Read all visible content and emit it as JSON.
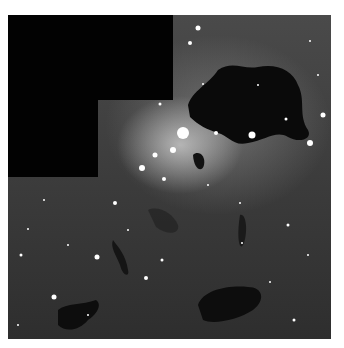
{
  "image": {
    "description": "Hubble WFPC2 mosaic of a star-forming region with dark dust globules and bright stars",
    "colors": {
      "background": "#3c3c3c",
      "mask": "#020202",
      "glow": "#ffffff",
      "dust": "#0a0a0a"
    },
    "stars": [
      [
        190,
        13,
        2.5
      ],
      [
        182,
        28,
        2
      ],
      [
        302,
        26,
        1
      ],
      [
        195,
        69,
        1
      ],
      [
        152,
        89,
        1.5
      ],
      [
        175,
        118,
        6
      ],
      [
        165,
        135,
        3
      ],
      [
        147,
        140,
        2.5
      ],
      [
        134,
        153,
        3
      ],
      [
        156,
        164,
        2
      ],
      [
        208,
        118,
        2
      ],
      [
        244,
        120,
        3.5
      ],
      [
        302,
        128,
        3
      ],
      [
        315,
        100,
        2.5
      ],
      [
        278,
        104,
        1.5
      ],
      [
        107,
        188,
        2
      ],
      [
        89,
        242,
        2.5
      ],
      [
        154,
        245,
        1.5
      ],
      [
        138,
        263,
        2
      ],
      [
        46,
        282,
        2.5
      ],
      [
        13,
        240,
        1.5
      ],
      [
        20,
        214,
        1
      ],
      [
        36,
        185,
        1
      ],
      [
        232,
        188,
        1
      ],
      [
        280,
        210,
        1.5
      ],
      [
        234,
        228,
        1
      ],
      [
        262,
        267,
        1
      ],
      [
        286,
        305,
        1.5
      ],
      [
        10,
        310,
        1
      ],
      [
        80,
        300,
        1
      ],
      [
        200,
        170,
        1
      ],
      [
        120,
        215,
        1
      ],
      [
        300,
        240,
        1
      ],
      [
        60,
        230,
        1
      ],
      [
        250,
        70,
        1
      ],
      [
        310,
        60,
        1
      ]
    ]
  }
}
